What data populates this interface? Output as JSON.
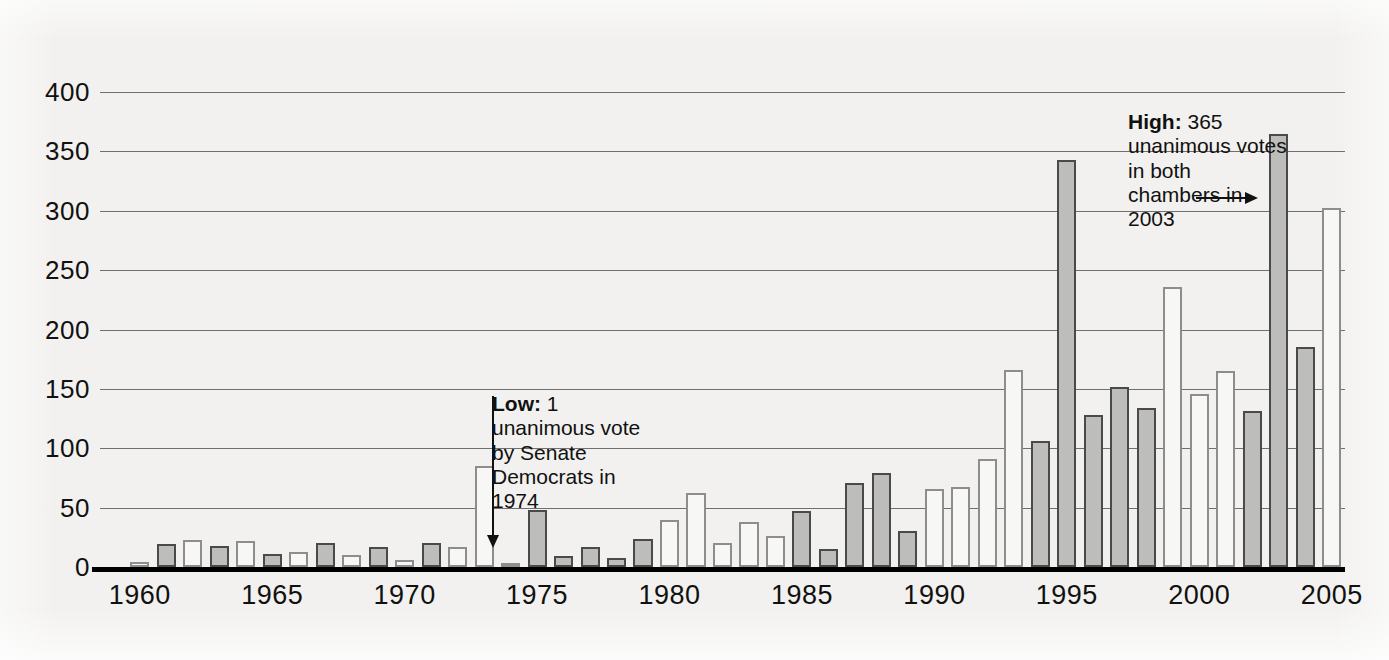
{
  "chart_data": {
    "type": "bar",
    "title": "",
    "xlabel": "",
    "ylabel": "",
    "xlim": [
      1959,
      2006
    ],
    "ylim": [
      0,
      400
    ],
    "grid": true,
    "legend": "none",
    "ytick_labels": [
      "400",
      "350",
      "300",
      "250",
      "200",
      "150",
      "100",
      "50",
      "0"
    ],
    "yticks": [
      400,
      350,
      300,
      250,
      200,
      150,
      100,
      50,
      0
    ],
    "xtick_labels": [
      "1960",
      "1965",
      "1970",
      "1975",
      "1980",
      "1985",
      "1990",
      "1995",
      "2000",
      "2005"
    ],
    "xticks": [
      1960,
      1965,
      1970,
      1975,
      1980,
      1985,
      1990,
      1995,
      2000,
      2005
    ],
    "categories": [
      1960,
      1961,
      1962,
      1963,
      1964,
      1965,
      1966,
      1967,
      1968,
      1969,
      1970,
      1971,
      1972,
      1973,
      1974,
      1975,
      1976,
      1977,
      1978,
      1979,
      1980,
      1981,
      1982,
      1983,
      1984,
      1985,
      1986,
      1987,
      1988,
      1989,
      1990,
      1991,
      1992,
      1993,
      1994,
      1995,
      1996,
      1997,
      1998,
      1999,
      2000,
      2001,
      2002,
      2003,
      2004,
      2005
    ],
    "values": [
      4,
      19,
      23,
      18,
      22,
      11,
      13,
      20,
      10,
      17,
      6,
      20,
      17,
      85,
      1,
      48,
      9,
      17,
      8,
      24,
      40,
      62,
      20,
      38,
      26,
      47,
      15,
      71,
      79,
      30,
      66,
      67,
      91,
      166,
      106,
      343,
      128,
      152,
      134,
      236,
      146,
      165,
      131,
      365,
      185,
      302
    ],
    "bar_styles": [
      "light",
      "dark",
      "light",
      "dark",
      "light",
      "dark",
      "light",
      "dark",
      "light",
      "dark",
      "light",
      "dark",
      "light",
      "light",
      "light",
      "dark",
      "dark",
      "dark",
      "dark",
      "dark",
      "light",
      "light",
      "light",
      "light",
      "light",
      "dark",
      "dark",
      "dark",
      "dark",
      "dark",
      "light",
      "light",
      "light",
      "light",
      "dark",
      "dark",
      "dark",
      "dark",
      "dark",
      "light",
      "light",
      "light",
      "dark",
      "dark",
      "dark",
      "light"
    ]
  },
  "annotations": {
    "low": {
      "label": "Low:",
      "value": "1",
      "body": "unanimous vote by Senate Democrats in 1974",
      "arrow": "arrow-down"
    },
    "high": {
      "label": "High:",
      "value": "365",
      "body": "unanimous votes in both chambers in 2003",
      "arrow": "arrow-right"
    }
  },
  "colors": {
    "background": "#f2f1ef",
    "bar_light_fill": "#f7f7f5",
    "bar_light_stroke": "#8d8d8d",
    "bar_dark_fill": "#bdbdbb",
    "bar_dark_stroke": "#4a4a4a",
    "gridline": "#6f6f6f",
    "axis": "#000000",
    "text": "#111111"
  }
}
